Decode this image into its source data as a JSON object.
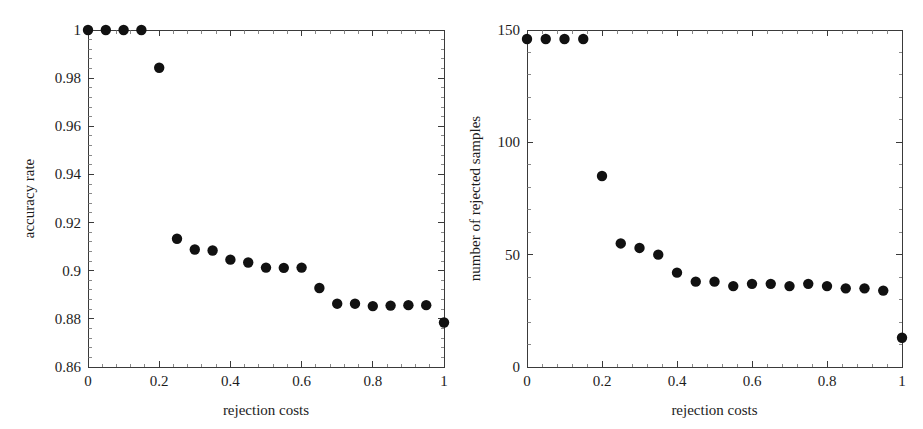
{
  "figure": {
    "background": "#ffffff",
    "marker_color": "#111111",
    "axis_color": "#3a3a3a",
    "panel_count": 2
  },
  "chart_data": [
    {
      "type": "scatter",
      "panel": "left",
      "title": "",
      "xlabel": "rejection costs",
      "ylabel": "accuracy rate",
      "xlim": [
        0,
        1
      ],
      "ylim": [
        0.86,
        1.0
      ],
      "grid": false,
      "legend": null,
      "xticks": [
        0,
        0.2,
        0.4,
        0.6,
        0.8,
        1
      ],
      "xticklabels": [
        "0",
        "0.2",
        "0.4",
        "0.6",
        "0.8",
        "1"
      ],
      "yticks": [
        0.86,
        0.88,
        0.9,
        0.92,
        0.94,
        0.96,
        0.98,
        1.0
      ],
      "yticklabels": [
        "0.86",
        "0.88",
        "0.9",
        "0.92",
        "0.94",
        "0.96",
        "0.98",
        "1"
      ],
      "x": [
        0,
        0.05,
        0.1,
        0.15,
        0.2,
        0.25,
        0.3,
        0.35,
        0.4,
        0.45,
        0.5,
        0.55,
        0.6,
        0.65,
        0.7,
        0.75,
        0.8,
        0.85,
        0.9,
        0.95,
        1.0
      ],
      "values": [
        1.0,
        1.0,
        1.0,
        1.0,
        0.9843,
        0.9133,
        0.9088,
        0.9084,
        0.9046,
        0.9034,
        0.9013,
        0.9012,
        0.9013,
        0.8928,
        0.8863,
        0.8863,
        0.8853,
        0.8855,
        0.8857,
        0.8857,
        0.8785
      ]
    },
    {
      "type": "scatter",
      "panel": "right",
      "title": "",
      "xlabel": "rejection costs",
      "ylabel": "number of rejected samples",
      "xlim": [
        0,
        1
      ],
      "ylim": [
        0,
        150
      ],
      "grid": false,
      "legend": null,
      "xticks": [
        0,
        0.2,
        0.4,
        0.6,
        0.8,
        1
      ],
      "xticklabels": [
        "0",
        "0.2",
        "0.4",
        "0.6",
        "0.8",
        "1"
      ],
      "yticks": [
        0,
        50,
        100,
        150
      ],
      "yticklabels": [
        "0",
        "50",
        "100",
        "150"
      ],
      "x": [
        0,
        0.05,
        0.1,
        0.15,
        0.2,
        0.25,
        0.3,
        0.35,
        0.4,
        0.45,
        0.5,
        0.55,
        0.6,
        0.65,
        0.7,
        0.75,
        0.8,
        0.85,
        0.9,
        0.95,
        1.0
      ],
      "values": [
        146,
        146,
        146,
        146,
        85,
        55,
        53,
        50,
        42,
        38,
        38,
        36,
        37,
        37,
        36,
        37,
        36,
        35,
        35,
        34,
        13
      ]
    }
  ]
}
